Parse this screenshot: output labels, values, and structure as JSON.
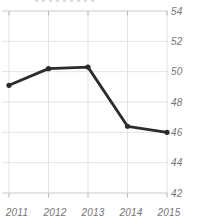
{
  "chart_data": {
    "type": "line",
    "title": "",
    "xlabel": "",
    "ylabel": "",
    "x": [
      "2011",
      "2012",
      "2013",
      "2014",
      "2015"
    ],
    "series": [
      {
        "name": "series-1",
        "values": [
          49.1,
          50.2,
          50.3,
          46.4,
          46.0
        ]
      }
    ],
    "ylim": [
      42,
      54
    ],
    "y_ticks": [
      54,
      52,
      50,
      48,
      46,
      44,
      42
    ],
    "y_axis_side": "right",
    "grid": true,
    "legend_position": "none",
    "colors": {
      "line": "#2b2b2b",
      "marker": "#2b2b2b",
      "grid": "#e3e3e3",
      "axis": "#cbcbcb",
      "tick": "#b8b8b8",
      "label": "#757575",
      "background": "#ffffff"
    }
  }
}
